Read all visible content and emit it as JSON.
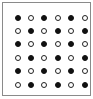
{
  "grid": {
    "rows": 6,
    "cols": 6,
    "pattern": [
      [
        1,
        0,
        1,
        0,
        1,
        0
      ],
      [
        0,
        1,
        0,
        1,
        0,
        1
      ],
      [
        1,
        0,
        1,
        0,
        1,
        0
      ],
      [
        0,
        1,
        0,
        1,
        0,
        1
      ],
      [
        1,
        0,
        1,
        0,
        1,
        0
      ],
      [
        0,
        1,
        0,
        1,
        0,
        1
      ]
    ],
    "legend": {
      "1": "filled-dot",
      "0": "hollow-dot"
    }
  },
  "colors": {
    "filled": "#111111",
    "hollow_border": "#222222",
    "frame": "#8a8a8a"
  }
}
